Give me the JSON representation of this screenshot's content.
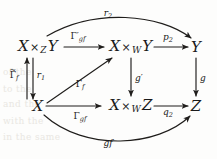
{
  "diagram": {
    "type": "commutative-diagram",
    "nodes": [
      {
        "id": "top-left",
        "text": "X ×Z Y",
        "base": "X",
        "op": "×",
        "sub": "Z",
        "tail": "Y",
        "x": 38,
        "y": 47
      },
      {
        "id": "top-middle",
        "text": "X ×W Y",
        "base": "X",
        "op": "×",
        "sub": "W",
        "tail": "Y",
        "x": 131,
        "y": 47
      },
      {
        "id": "top-right",
        "text": "Y",
        "base": "Y",
        "op": "",
        "sub": "",
        "tail": "",
        "x": 196,
        "y": 47
      },
      {
        "id": "bottom-left",
        "text": "X",
        "base": "X",
        "op": "",
        "sub": "",
        "tail": "",
        "x": 38,
        "y": 106
      },
      {
        "id": "bottom-middle",
        "text": "X ×W Z",
        "base": "X",
        "op": "×",
        "sub": "W",
        "tail": "Z",
        "x": 131,
        "y": 106
      },
      {
        "id": "bottom-right",
        "text": "Z",
        "base": "Z",
        "op": "",
        "sub": "",
        "tail": "",
        "x": 196,
        "y": 106
      }
    ],
    "arrow_labels": [
      {
        "id": "top-curve",
        "glyph": "r",
        "sub": "2",
        "accent": "",
        "x": 108,
        "y": 14
      },
      {
        "id": "top-left-arrow",
        "glyph": "Γ",
        "sub": "gf",
        "prime": true,
        "accent": "",
        "x": 78,
        "y": 38
      },
      {
        "id": "top-right-arrow",
        "glyph": "p",
        "sub": "2",
        "accent": "",
        "x": 168,
        "y": 38
      },
      {
        "id": "left-up-arrow",
        "glyph": "Γ",
        "sub": "f",
        "accent": "~",
        "x": 14,
        "y": 76
      },
      {
        "id": "left-down-arrow",
        "glyph": "r",
        "sub": "1",
        "accent": "",
        "x": 40,
        "y": 76
      },
      {
        "id": "diagonal-arrow",
        "glyph": "Γ",
        "sub": "f",
        "accent": "",
        "x": 80,
        "y": 85
      },
      {
        "id": "middle-vertical",
        "glyph": "g",
        "sub": "",
        "prime": true,
        "accent": "",
        "x": 139,
        "y": 78
      },
      {
        "id": "right-vertical",
        "glyph": "g",
        "sub": "",
        "accent": "",
        "x": 203,
        "y": 78
      },
      {
        "id": "bottom-left-arrow",
        "glyph": "Γ",
        "sub": "gf",
        "accent": "",
        "x": 80,
        "y": 117
      },
      {
        "id": "bottom-right-arrow",
        "glyph": "q",
        "sub": "2",
        "accent": "",
        "x": 168,
        "y": 113
      },
      {
        "id": "bottom-curve",
        "glyph": "gf",
        "sub": "",
        "accent": "",
        "x": 108,
        "y": 143
      }
    ],
    "ink_color": "#1f1d1b",
    "paper_color": "#fdfdfc",
    "background_fragments": [
      {
        "text": "of the",
        "x": 3,
        "y": 72
      },
      {
        "text": "to the",
        "x": 3,
        "y": 89
      },
      {
        "text": "and the",
        "x": 3,
        "y": 104
      },
      {
        "text": "with the",
        "x": 3,
        "y": 121
      },
      {
        "text": "in the same",
        "x": 3,
        "y": 137
      }
    ]
  }
}
